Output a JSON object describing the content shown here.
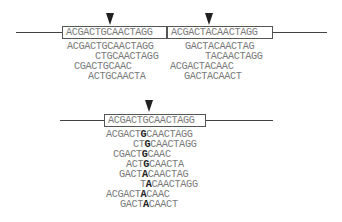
{
  "top": {
    "reference_left": "ACGACTGCAACTAGG",
    "reference_right": "ACGACTACAACTAGG",
    "reads_left": [
      "ACGACTGCAACTAGG",
      "CTGCAACTAGG",
      "CGACTGCAAC",
      "ACTGCAACTA"
    ],
    "reads_right": [
      "GACTACAACTAG",
      "TACAACTAGG",
      "ACGACTACAAC",
      "GACTACAACT"
    ]
  },
  "bottom": {
    "reference": "ACGACTGCAACTAGG",
    "reads": [
      {
        "pre": "ACGACT",
        "var": "G",
        "post": "CAACTAGG"
      },
      {
        "pre": "CT",
        "var": "G",
        "post": "CAACTAGG"
      },
      {
        "pre": "CGACT",
        "var": "G",
        "post": "CAAC"
      },
      {
        "pre": "ACT",
        "var": "G",
        "post": "CAACTA"
      },
      {
        "pre": "GACT",
        "var": "A",
        "post": "CAACTAG"
      },
      {
        "pre": "T",
        "var": "A",
        "post": "CAACTAGG"
      },
      {
        "pre": "ACGACT",
        "var": "A",
        "post": "CAAC"
      },
      {
        "pre": "GACT",
        "var": "A",
        "post": "CAACT"
      }
    ]
  }
}
